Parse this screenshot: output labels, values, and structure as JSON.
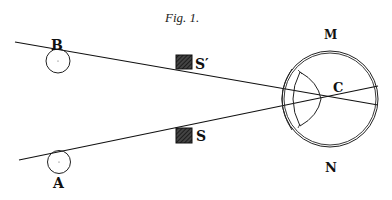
{
  "figure": {
    "title": "Fig. 1.",
    "labels": {
      "B": "B",
      "A": "A",
      "S_prime": "S′",
      "S": "S",
      "C": "C",
      "M": "M",
      "N": "N"
    }
  }
}
